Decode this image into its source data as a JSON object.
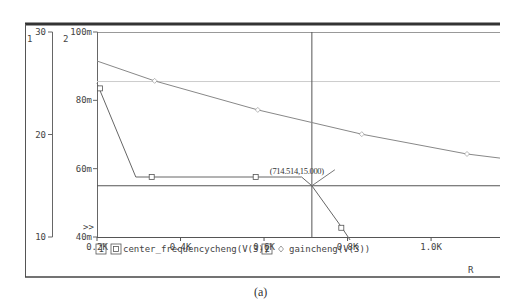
{
  "caption": "(a)",
  "chart_data": {
    "type": "line",
    "title": "",
    "xlabel": "R",
    "x_range": [
      0.2,
      1.165
    ],
    "x_ticks": [
      {
        "value": 0.2,
        "label": "0.2K"
      },
      {
        "value": 0.4,
        "label": "0.4K"
      },
      {
        "value": 0.6,
        "label": "0.6K"
      },
      {
        "value": 0.8,
        "label": "0.8K"
      },
      {
        "value": 1.0,
        "label": "1.0K"
      }
    ],
    "axes": [
      {
        "id": "1",
        "label": "1",
        "range": [
          10,
          30
        ],
        "ticks": [
          {
            "value": 30,
            "label": "30"
          },
          {
            "value": 20,
            "label": "20"
          },
          {
            "value": 10,
            "label": "10"
          }
        ]
      },
      {
        "id": "2",
        "label": "2",
        "range": [
          0.04,
          0.1
        ],
        "ticks": [
          {
            "value": 0.1,
            "label": "100m"
          },
          {
            "value": 0.08,
            "label": "80m"
          },
          {
            "value": 0.06,
            "label": "60m"
          },
          {
            "value": 0.04,
            "label": "40m"
          }
        ],
        "overflow_marker": ">>"
      }
    ],
    "series": [
      {
        "index": "1",
        "name": "center_frequencycheng(V(3))",
        "axis": "1",
        "marker": "square",
        "x": [
          0.2,
          0.293,
          0.331,
          0.58,
          0.69,
          0.7145,
          0.785,
          0.806
        ],
        "y": [
          25.0,
          15.85,
          15.85,
          15.85,
          15.85,
          15.0,
          11.0,
          9.7
        ],
        "marker_points": [
          [
            0.207,
            24.5
          ],
          [
            0.331,
            15.85
          ],
          [
            0.58,
            15.85
          ],
          [
            0.785,
            10.9
          ]
        ]
      },
      {
        "index": "2",
        "name": "gaincheng(V(3))",
        "axis": "2",
        "marker": "diamond",
        "x": [
          0.2,
          0.338,
          0.585,
          0.834,
          1.086,
          1.165
        ],
        "y": [
          0.0915,
          0.0857,
          0.0772,
          0.0701,
          0.0643,
          0.0631
        ],
        "marker_points": [
          [
            0.338,
            0.0857
          ],
          [
            0.585,
            0.0772
          ],
          [
            0.834,
            0.0701
          ],
          [
            1.086,
            0.0643
          ]
        ]
      }
    ],
    "cursor": {
      "x": 714.514,
      "y": 15.0,
      "label": "(714.514,15.000)"
    },
    "reference_line_axis2": 0.0855,
    "grid": false,
    "legend": "bottom"
  }
}
